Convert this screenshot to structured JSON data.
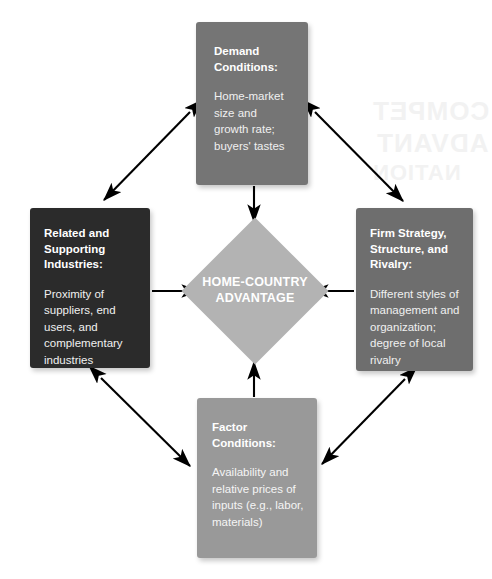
{
  "diagram": {
    "name": "Porter's Diamond — Determinants of National Competitive Advantage",
    "center": {
      "label": "HOME-COUNTRY\nADVANTAGE",
      "color": "#b3b3b3",
      "shape": "diamond"
    },
    "nodes": [
      {
        "id": "demand",
        "position": "top",
        "title": "Demand Conditions:",
        "body": "Home-market size and growth rate; buyers' tastes",
        "color": "#757575",
        "text_color": "#ffffff"
      },
      {
        "id": "related",
        "position": "left",
        "title": "Related and Supporting Industries:",
        "body": "Proximity of suppliers, end users, and complementary industries",
        "color": "#2b2b2b",
        "text_color": "#ffffff"
      },
      {
        "id": "firm",
        "position": "right",
        "title": "Firm Strategy, Structure, and Rivalry:",
        "body": "Different styles of management and organization; degree of local rivalry",
        "color": "#6e6e6e",
        "text_color": "#ffffff"
      },
      {
        "id": "factor",
        "position": "bottom",
        "title": "Factor Conditions:",
        "body": "Availability and relative prices of inputs (e.g., labor, materials)",
        "color": "#999999",
        "text_color": "#ffffff"
      }
    ],
    "connectors": [
      {
        "from": "related",
        "to": "center",
        "arrow": "single",
        "orientation": "horizontal"
      },
      {
        "from": "firm",
        "to": "center",
        "arrow": "single",
        "orientation": "horizontal"
      },
      {
        "from": "demand",
        "to": "center",
        "arrow": "single",
        "orientation": "vertical"
      },
      {
        "from": "factor",
        "to": "center",
        "arrow": "single",
        "orientation": "vertical"
      },
      {
        "from": "demand",
        "to": "related",
        "arrow": "double",
        "orientation": "diagonal"
      },
      {
        "from": "demand",
        "to": "firm",
        "arrow": "double",
        "orientation": "diagonal"
      },
      {
        "from": "related",
        "to": "factor",
        "arrow": "double",
        "orientation": "diagonal"
      },
      {
        "from": "firm",
        "to": "factor",
        "arrow": "double",
        "orientation": "diagonal"
      }
    ],
    "ghost_text": {
      "line1": "COMPET",
      "line2": "ADVANT",
      "line3": "NATION"
    },
    "background_color": "#ffffff",
    "arrow_color": "#000000"
  }
}
